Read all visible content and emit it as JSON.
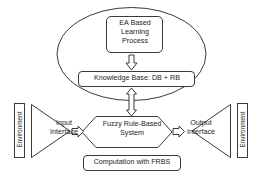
{
  "diagram": {
    "stroke_color": "#3a3a3a",
    "fill_color": "#ffffff",
    "text_color": "#1d1d1d",
    "nodes": {
      "ea_box": {
        "label": "EA Based\nLearning\nProcess",
        "shape": "rounded-rectangle"
      },
      "knowledge_base": {
        "label": "Knowledge Base: DB + RB",
        "shape": "rounded-rectangle"
      },
      "frbs": {
        "label": "Fuzzy Rule-Based\nSystem",
        "shape": "hexagon"
      },
      "computation": {
        "label": "Computation with FRBS",
        "shape": "rounded-rectangle"
      },
      "input_interface": {
        "label": "Input\nInterface",
        "shape": "triangle-right"
      },
      "output_interface": {
        "label": "Output\nInterface",
        "shape": "triangle-left"
      },
      "environment_left": {
        "label": "Environment",
        "shape": "vertical-bar"
      },
      "environment_right": {
        "label": "Environment",
        "shape": "vertical-bar"
      }
    },
    "connectors": {
      "ea_to_kb": {
        "direction": "down",
        "style": "block-arrow"
      },
      "kb_to_frbs": {
        "direction": "both",
        "style": "block-double-arrow"
      },
      "input_to_frbs": {
        "direction": "right",
        "style": "block-arrow"
      },
      "frbs_to_output": {
        "direction": "right",
        "style": "block-arrow"
      }
    },
    "grouping_ellipse": {
      "contains": [
        "ea_box",
        "knowledge_base"
      ]
    }
  }
}
